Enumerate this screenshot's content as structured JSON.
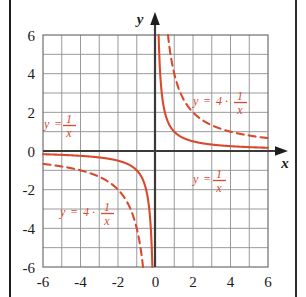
{
  "figure": {
    "x_axis_label": "x",
    "y_axis_label": "y",
    "grid": "on",
    "background_color": "#ffffff",
    "curve_color": "#d9492f",
    "grid_color": "#8e8e8e",
    "axis_color": "#3a3a3a"
  },
  "ticks": {
    "x": [
      "-6",
      "-4",
      "-2",
      "0",
      "2",
      "4",
      "6"
    ],
    "y": [
      "6",
      "4",
      "2",
      "0",
      "-2",
      "-4",
      "-6"
    ]
  },
  "labels": {
    "upper_left": {
      "lhs": "y",
      "eq": "=",
      "coef": "",
      "dot": "",
      "num": "1",
      "den": "x"
    },
    "upper_right": {
      "lhs": "y",
      "eq": "=",
      "coef": "4",
      "dot": "·",
      "num": "1",
      "den": "x"
    },
    "lower_left": {
      "lhs": "y",
      "eq": "=",
      "coef": "4",
      "dot": "·",
      "num": "1",
      "den": "x"
    },
    "lower_right": {
      "lhs": "y",
      "eq": "=",
      "coef": "",
      "dot": "",
      "num": "1",
      "den": "x"
    }
  },
  "chart_data": {
    "type": "line",
    "title": "",
    "xlabel": "x",
    "ylabel": "y",
    "xlim": [
      -6,
      6
    ],
    "ylim": [
      -6,
      6
    ],
    "xticks": [
      -6,
      -4,
      -2,
      0,
      2,
      4,
      6
    ],
    "yticks": [
      -6,
      -4,
      -2,
      0,
      2,
      4,
      6
    ],
    "grid": true,
    "grid_step": 1,
    "legend": "inline-annotations",
    "series": [
      {
        "name": "y = 1/x",
        "style": "solid",
        "color": "#d9492f",
        "formula": "y = 1/x",
        "coefficient": 1,
        "asymptotes": {
          "vertical": 0,
          "horizontal": 0
        },
        "points_branch_positive": [
          [
            0.167,
            6.0
          ],
          [
            0.2,
            5.0
          ],
          [
            0.25,
            4.0
          ],
          [
            0.333,
            3.0
          ],
          [
            0.4,
            2.5
          ],
          [
            0.5,
            2.0
          ],
          [
            0.667,
            1.5
          ],
          [
            0.8,
            1.25
          ],
          [
            1.0,
            1.0
          ],
          [
            1.5,
            0.667
          ],
          [
            2.0,
            0.5
          ],
          [
            2.5,
            0.4
          ],
          [
            3.0,
            0.333
          ],
          [
            4.0,
            0.25
          ],
          [
            5.0,
            0.2
          ],
          [
            6.0,
            0.167
          ]
        ],
        "points_branch_negative": [
          [
            -6.0,
            -0.167
          ],
          [
            -5.0,
            -0.2
          ],
          [
            -4.0,
            -0.25
          ],
          [
            -3.0,
            -0.333
          ],
          [
            -2.5,
            -0.4
          ],
          [
            -2.0,
            -0.5
          ],
          [
            -1.5,
            -0.667
          ],
          [
            -1.0,
            -1.0
          ],
          [
            -0.8,
            -1.25
          ],
          [
            -0.667,
            -1.5
          ],
          [
            -0.5,
            -2.0
          ],
          [
            -0.4,
            -2.5
          ],
          [
            -0.333,
            -3.0
          ],
          [
            -0.25,
            -4.0
          ],
          [
            -0.2,
            -5.0
          ],
          [
            -0.167,
            -6.0
          ]
        ]
      },
      {
        "name": "y = 4 * 1/x",
        "style": "dashed",
        "color": "#d9492f",
        "formula": "y = 4/x",
        "coefficient": 4,
        "asymptotes": {
          "vertical": 0,
          "horizontal": 0
        },
        "points_branch_positive": [
          [
            0.667,
            6.0
          ],
          [
            0.8,
            5.0
          ],
          [
            1.0,
            4.0
          ],
          [
            1.333,
            3.0
          ],
          [
            1.6,
            2.5
          ],
          [
            2.0,
            2.0
          ],
          [
            2.667,
            1.5
          ],
          [
            3.2,
            1.25
          ],
          [
            4.0,
            1.0
          ],
          [
            5.0,
            0.8
          ],
          [
            6.0,
            0.667
          ]
        ],
        "points_branch_negative": [
          [
            -6.0,
            -0.667
          ],
          [
            -5.0,
            -0.8
          ],
          [
            -4.0,
            -1.0
          ],
          [
            -3.2,
            -1.25
          ],
          [
            -2.667,
            -1.5
          ],
          [
            -2.0,
            -2.0
          ],
          [
            -1.6,
            -2.5
          ],
          [
            -1.333,
            -3.0
          ],
          [
            -1.0,
            -4.0
          ],
          [
            -0.8,
            -5.0
          ],
          [
            -0.667,
            -6.0
          ]
        ]
      }
    ],
    "annotations": [
      {
        "text": "y = 1/x",
        "x": -4.6,
        "y": 1.9,
        "series": "y = 1/x"
      },
      {
        "text": "y = 4 * 1/x",
        "x": 2.0,
        "y": 2.6,
        "series": "y = 4 * 1/x"
      },
      {
        "text": "y = 1/x",
        "x": 2.1,
        "y": -1.3,
        "series": "y = 1/x"
      },
      {
        "text": "y = 4 * 1/x",
        "x": -4.6,
        "y": -3.2,
        "series": "y = 4 * 1/x"
      }
    ]
  }
}
